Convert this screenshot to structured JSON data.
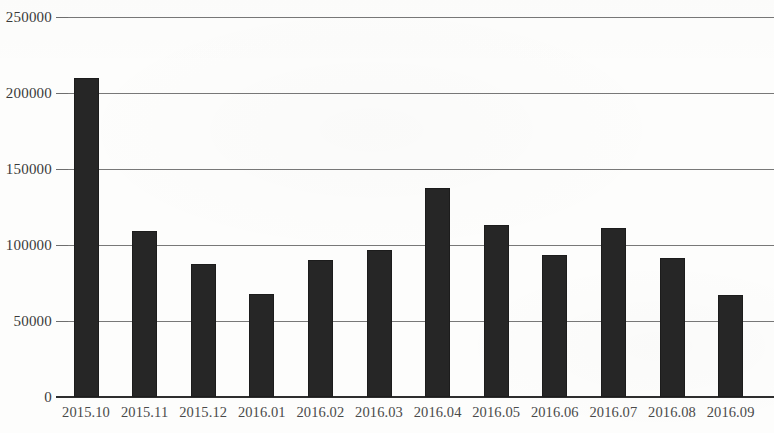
{
  "chart_data": {
    "type": "bar",
    "title": "",
    "subtitle": "",
    "xlabel": "",
    "ylabel": "",
    "categories": [
      "2015.10",
      "2015.11",
      "2015.12",
      "2016.01",
      "2016.02",
      "2016.03",
      "2016.04",
      "2016.05",
      "2016.06",
      "2016.07",
      "2016.08",
      "2016.09"
    ],
    "values": [
      210000,
      109000,
      87500,
      67500,
      90000,
      97000,
      137500,
      113000,
      93500,
      111000,
      91500,
      67000
    ],
    "series": [
      {
        "name": "",
        "values": [
          210000,
          109000,
          87500,
          67500,
          90000,
          97000,
          137500,
          113000,
          93500,
          111000,
          91500,
          67000
        ]
      }
    ],
    "ylim": [
      0,
      250000
    ],
    "y_ticks": [
      0,
      50000,
      100000,
      150000,
      200000,
      250000
    ],
    "y_tick_labels": [
      "0",
      "50000",
      "100000",
      "150000",
      "200000",
      "250000"
    ],
    "grid": true,
    "grid_axis": "y",
    "legend": false,
    "legend_position": "none",
    "bar_color": "#262626",
    "gridline_color": "#787878",
    "axis_color": "#2e2e2e",
    "background_color": "#fdfdfc"
  },
  "layout": {
    "plot_left": 66,
    "plot_right": 774,
    "baseline_y": 397,
    "top_y": 17,
    "bar_width": 25,
    "bar_step": 58.6,
    "first_bar_center": 86
  }
}
